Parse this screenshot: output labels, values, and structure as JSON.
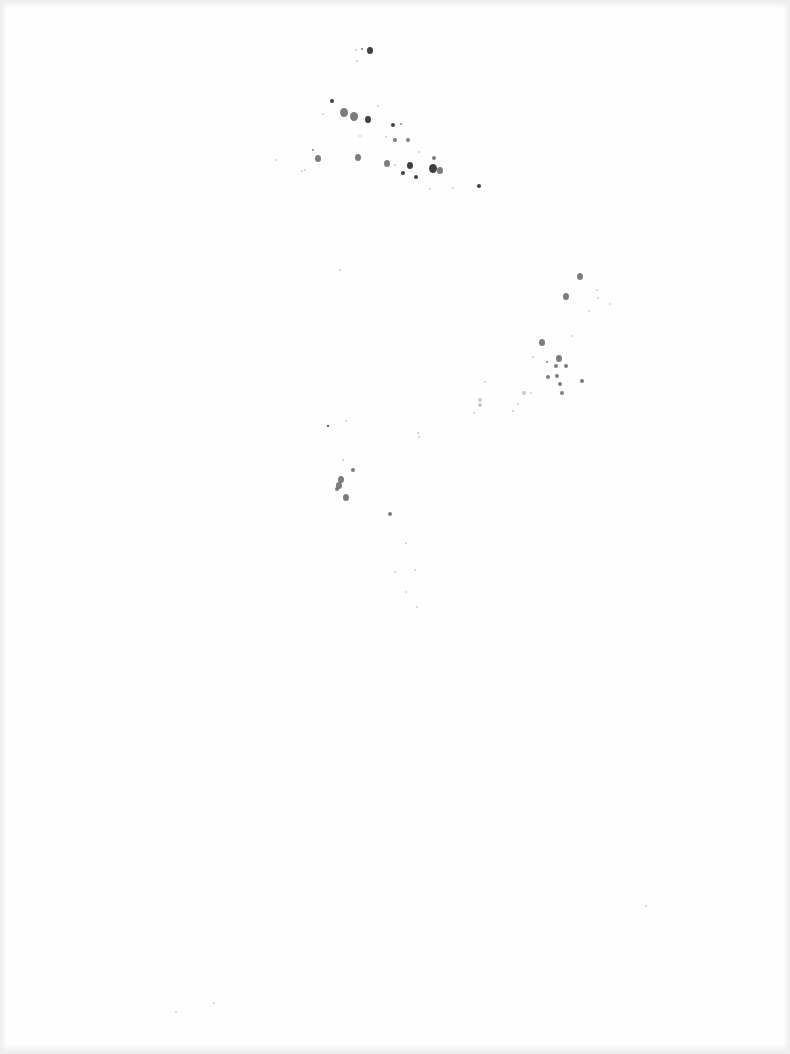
{
  "page": {
    "type": "blank scanned page",
    "text": "",
    "background_color": "#fefefe",
    "speck_color_dark": "#2b2b2b",
    "speck_color_mid": "#6e6e6e",
    "speck_color_light": "#b5b5b5"
  },
  "speckles": [
    {
      "x": 370,
      "y": 50,
      "r": 3,
      "c": "dark"
    },
    {
      "x": 362,
      "y": 49,
      "r": 1,
      "c": "mid"
    },
    {
      "x": 356,
      "y": 50,
      "r": 1,
      "c": "light"
    },
    {
      "x": 357,
      "y": 61,
      "r": 1,
      "c": "light"
    },
    {
      "x": 332,
      "y": 101,
      "r": 2,
      "c": "dark"
    },
    {
      "x": 344,
      "y": 112,
      "r": 4,
      "c": "mid"
    },
    {
      "x": 354,
      "y": 116,
      "r": 4,
      "c": "mid"
    },
    {
      "x": 368,
      "y": 119,
      "r": 3,
      "c": "dark"
    },
    {
      "x": 378,
      "y": 106,
      "r": 1,
      "c": "light"
    },
    {
      "x": 393,
      "y": 125,
      "r": 2,
      "c": "dark"
    },
    {
      "x": 401,
      "y": 124,
      "r": 1,
      "c": "mid"
    },
    {
      "x": 395,
      "y": 140,
      "r": 2,
      "c": "mid"
    },
    {
      "x": 408,
      "y": 140,
      "r": 2,
      "c": "mid"
    },
    {
      "x": 386,
      "y": 137,
      "r": 1,
      "c": "light"
    },
    {
      "x": 360,
      "y": 136,
      "r": 1,
      "c": "light"
    },
    {
      "x": 318,
      "y": 158,
      "r": 3,
      "c": "mid"
    },
    {
      "x": 313,
      "y": 150,
      "r": 1,
      "c": "mid"
    },
    {
      "x": 358,
      "y": 157,
      "r": 3,
      "c": "mid"
    },
    {
      "x": 387,
      "y": 163,
      "r": 3,
      "c": "mid"
    },
    {
      "x": 395,
      "y": 165,
      "r": 1,
      "c": "light"
    },
    {
      "x": 410,
      "y": 165,
      "r": 3,
      "c": "dark"
    },
    {
      "x": 403,
      "y": 173,
      "r": 2,
      "c": "dark"
    },
    {
      "x": 416,
      "y": 177,
      "r": 2,
      "c": "dark"
    },
    {
      "x": 433,
      "y": 168,
      "r": 4,
      "c": "dark"
    },
    {
      "x": 440,
      "y": 170,
      "r": 3,
      "c": "mid"
    },
    {
      "x": 434,
      "y": 158,
      "r": 2,
      "c": "mid"
    },
    {
      "x": 479,
      "y": 186,
      "r": 2,
      "c": "dark"
    },
    {
      "x": 305,
      "y": 170,
      "r": 1,
      "c": "light"
    },
    {
      "x": 302,
      "y": 171,
      "r": 1,
      "c": "light"
    },
    {
      "x": 276,
      "y": 160,
      "r": 1,
      "c": "light"
    },
    {
      "x": 430,
      "y": 189,
      "r": 1,
      "c": "light"
    },
    {
      "x": 453,
      "y": 188,
      "r": 1,
      "c": "light"
    },
    {
      "x": 419,
      "y": 152,
      "r": 1,
      "c": "light"
    },
    {
      "x": 323,
      "y": 114,
      "r": 1,
      "c": "light"
    },
    {
      "x": 580,
      "y": 276,
      "r": 3,
      "c": "mid"
    },
    {
      "x": 566,
      "y": 296,
      "r": 3,
      "c": "mid"
    },
    {
      "x": 597,
      "y": 290,
      "r": 1,
      "c": "light"
    },
    {
      "x": 598,
      "y": 298,
      "r": 1,
      "c": "light"
    },
    {
      "x": 589,
      "y": 311,
      "r": 1,
      "c": "light"
    },
    {
      "x": 542,
      "y": 342,
      "r": 3,
      "c": "mid"
    },
    {
      "x": 559,
      "y": 358,
      "r": 3,
      "c": "mid"
    },
    {
      "x": 566,
      "y": 366,
      "r": 2,
      "c": "mid"
    },
    {
      "x": 556,
      "y": 366,
      "r": 2,
      "c": "mid"
    },
    {
      "x": 557,
      "y": 376,
      "r": 2,
      "c": "mid"
    },
    {
      "x": 560,
      "y": 384,
      "r": 2,
      "c": "mid"
    },
    {
      "x": 548,
      "y": 377,
      "r": 2,
      "c": "mid"
    },
    {
      "x": 547,
      "y": 362,
      "r": 1,
      "c": "mid"
    },
    {
      "x": 533,
      "y": 357,
      "r": 1,
      "c": "light"
    },
    {
      "x": 582,
      "y": 381,
      "r": 2,
      "c": "mid"
    },
    {
      "x": 562,
      "y": 393,
      "r": 2,
      "c": "mid"
    },
    {
      "x": 572,
      "y": 336,
      "r": 1,
      "c": "light"
    },
    {
      "x": 524,
      "y": 393,
      "r": 2,
      "c": "light"
    },
    {
      "x": 531,
      "y": 393,
      "r": 1,
      "c": "light"
    },
    {
      "x": 518,
      "y": 404,
      "r": 1,
      "c": "light"
    },
    {
      "x": 513,
      "y": 411,
      "r": 1,
      "c": "light"
    },
    {
      "x": 480,
      "y": 400,
      "r": 2,
      "c": "light"
    },
    {
      "x": 480,
      "y": 405,
      "r": 2,
      "c": "light"
    },
    {
      "x": 474,
      "y": 413,
      "r": 1,
      "c": "light"
    },
    {
      "x": 485,
      "y": 382,
      "r": 1,
      "c": "light"
    },
    {
      "x": 610,
      "y": 304,
      "r": 1,
      "c": "light"
    },
    {
      "x": 328,
      "y": 426,
      "r": 1,
      "c": "dark"
    },
    {
      "x": 346,
      "y": 421,
      "r": 1,
      "c": "light"
    },
    {
      "x": 418,
      "y": 433,
      "r": 1,
      "c": "light"
    },
    {
      "x": 419,
      "y": 437,
      "r": 1,
      "c": "light"
    },
    {
      "x": 353,
      "y": 470,
      "r": 2,
      "c": "mid"
    },
    {
      "x": 341,
      "y": 479,
      "r": 3,
      "c": "mid"
    },
    {
      "x": 339,
      "y": 485,
      "r": 3,
      "c": "mid"
    },
    {
      "x": 337,
      "y": 489,
      "r": 2,
      "c": "mid"
    },
    {
      "x": 346,
      "y": 497,
      "r": 3,
      "c": "mid"
    },
    {
      "x": 343,
      "y": 460,
      "r": 1,
      "c": "light"
    },
    {
      "x": 390,
      "y": 514,
      "r": 2,
      "c": "mid"
    },
    {
      "x": 406,
      "y": 543,
      "r": 1,
      "c": "light"
    },
    {
      "x": 395,
      "y": 572,
      "r": 1,
      "c": "light"
    },
    {
      "x": 415,
      "y": 570,
      "r": 1,
      "c": "light"
    },
    {
      "x": 406,
      "y": 592,
      "r": 1,
      "c": "light"
    },
    {
      "x": 417,
      "y": 607,
      "r": 1,
      "c": "light"
    },
    {
      "x": 340,
      "y": 270,
      "r": 1,
      "c": "light"
    },
    {
      "x": 646,
      "y": 906,
      "r": 1,
      "c": "light"
    },
    {
      "x": 176,
      "y": 1012,
      "r": 1,
      "c": "light"
    },
    {
      "x": 214,
      "y": 1003,
      "r": 1,
      "c": "light"
    }
  ]
}
